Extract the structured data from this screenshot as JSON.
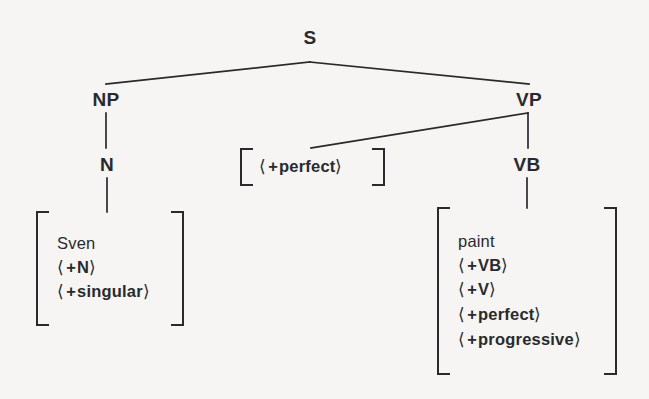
{
  "figure": {
    "type": "syntax-tree-diagram",
    "background_color": "#f6f5f3",
    "ink_color": "#2a2a2e"
  },
  "nodes": {
    "root": {
      "label": "S"
    },
    "np": {
      "label": "NP"
    },
    "vp": {
      "label": "VP"
    },
    "n": {
      "label": "N"
    },
    "vb": {
      "label": "VB"
    }
  },
  "matrices": {
    "subject": {
      "name": "subject-feature-matrix",
      "rows": [
        {
          "kind": "lexeme",
          "text": "Sven"
        },
        {
          "kind": "feature",
          "sign": "+",
          "feature": "N"
        },
        {
          "kind": "feature",
          "sign": "+",
          "feature": "singular"
        }
      ]
    },
    "aux": {
      "name": "aux-feature-matrix",
      "rows": [
        {
          "kind": "feature",
          "sign": "+",
          "feature": "perfect"
        }
      ]
    },
    "verb": {
      "name": "verb-feature-matrix",
      "rows": [
        {
          "kind": "lexeme",
          "text": "paint"
        },
        {
          "kind": "feature",
          "sign": "+",
          "feature": "VB"
        },
        {
          "kind": "feature",
          "sign": "+",
          "feature": "V"
        },
        {
          "kind": "feature",
          "sign": "+",
          "feature": "perfect"
        },
        {
          "kind": "feature",
          "sign": "+",
          "feature": "progressive"
        }
      ]
    }
  },
  "brackets": {
    "open": "⟨",
    "close": "⟩"
  }
}
